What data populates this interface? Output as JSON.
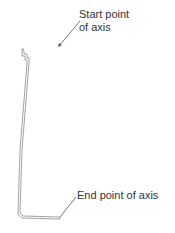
{
  "diagram": {
    "labels": {
      "start_line1": "Start point",
      "start_line2": "of axis",
      "end": "End point of axis"
    },
    "colors": {
      "stroke": "#8a8a8a",
      "leader": "#555555",
      "text": "#333333",
      "background": "#ffffff"
    }
  }
}
